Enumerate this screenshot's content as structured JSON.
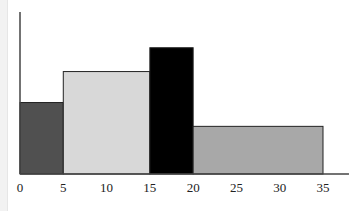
{
  "chart_data": {
    "type": "bar",
    "subtype": "histogram-variable-width",
    "title": "",
    "xlabel": "",
    "ylabel": "",
    "bins": [
      {
        "x0": 0,
        "x1": 5,
        "value": 3.0,
        "color": "#505050"
      },
      {
        "x0": 5,
        "x1": 15,
        "value": 4.3,
        "color": "#d8d8d8"
      },
      {
        "x0": 15,
        "x1": 20,
        "value": 5.3,
        "color": "#000000"
      },
      {
        "x0": 20,
        "x1": 35,
        "value": 2.0,
        "color": "#a8a8a8"
      }
    ],
    "xticks": [
      0,
      5,
      10,
      15,
      20,
      25,
      30,
      35
    ],
    "xlim": [
      0,
      38
    ],
    "ylim": [
      0,
      6.8
    ],
    "yticks": [],
    "grid": false,
    "legend": "none"
  }
}
